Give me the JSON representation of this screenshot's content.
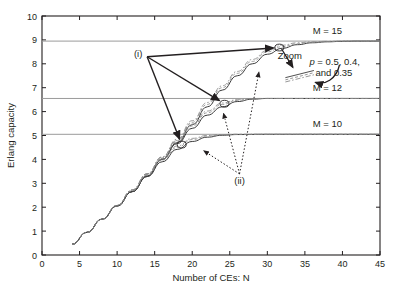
{
  "chart_data": {
    "type": "line",
    "title": "",
    "xlabel": "Number of CEs: N",
    "ylabel": "Erlang capacity",
    "xlim": [
      0,
      45
    ],
    "ylim": [
      0,
      10
    ],
    "xticks": [
      "0",
      "5",
      "10",
      "15",
      "20",
      "25",
      "30",
      "35",
      "40",
      "45"
    ],
    "yticks": [
      "0",
      "1",
      "2",
      "3",
      "4",
      "5",
      "6",
      "7",
      "8",
      "9",
      "10"
    ],
    "grid": false,
    "legend_position": "none",
    "series": [
      {
        "name": "M = 15, p = 0.5",
        "asymptote": 8.95,
        "style": "solid",
        "x": [
          4,
          6,
          8,
          10,
          12,
          14,
          16,
          18,
          20,
          22,
          24,
          26,
          28,
          30,
          32,
          34,
          36,
          38,
          40,
          42,
          45
        ],
        "y": [
          0.45,
          0.95,
          1.5,
          2.05,
          2.65,
          3.3,
          4.0,
          4.7,
          5.45,
          6.2,
          6.9,
          7.5,
          8.0,
          8.4,
          8.65,
          8.8,
          8.88,
          8.92,
          8.94,
          8.95,
          8.95
        ]
      },
      {
        "name": "M = 15, p = 0.4",
        "asymptote": 8.95,
        "style": "dashed",
        "x": [
          4,
          6,
          8,
          10,
          12,
          14,
          16,
          18,
          20,
          22,
          24,
          26,
          28,
          30,
          32,
          34,
          36,
          38,
          40,
          42,
          45
        ],
        "y": [
          0.45,
          0.95,
          1.5,
          2.05,
          2.68,
          3.35,
          4.05,
          4.78,
          5.55,
          6.3,
          7.0,
          7.6,
          8.1,
          8.5,
          8.72,
          8.84,
          8.9,
          8.93,
          8.95,
          8.95,
          8.95
        ]
      },
      {
        "name": "M = 15, p = 0.35",
        "asymptote": 8.95,
        "style": "dashdot",
        "x": [
          4,
          6,
          8,
          10,
          12,
          14,
          16,
          18,
          20,
          22,
          24,
          26,
          28,
          30,
          32,
          34,
          36,
          38,
          40,
          42,
          45
        ],
        "y": [
          0.45,
          0.95,
          1.5,
          2.08,
          2.72,
          3.4,
          4.1,
          4.85,
          5.62,
          6.38,
          7.08,
          7.68,
          8.18,
          8.56,
          8.78,
          8.88,
          8.92,
          8.94,
          8.95,
          8.95,
          8.95
        ]
      },
      {
        "name": "M = 12, p = 0.5",
        "asymptote": 6.55,
        "style": "solid",
        "x": [
          4,
          6,
          8,
          10,
          12,
          14,
          16,
          18,
          20,
          22,
          24,
          26,
          28,
          30,
          34,
          38,
          42,
          45
        ],
        "y": [
          0.45,
          0.95,
          1.5,
          2.05,
          2.65,
          3.3,
          4.0,
          4.66,
          5.3,
          5.85,
          6.2,
          6.42,
          6.52,
          6.55,
          6.55,
          6.55,
          6.55,
          6.55
        ]
      },
      {
        "name": "M = 12, p = 0.4",
        "asymptote": 6.55,
        "style": "dashed",
        "x": [
          4,
          6,
          8,
          10,
          12,
          14,
          16,
          18,
          20,
          22,
          24,
          26,
          28,
          30,
          34,
          38,
          42,
          45
        ],
        "y": [
          0.45,
          0.95,
          1.5,
          2.05,
          2.68,
          3.35,
          4.05,
          4.74,
          5.4,
          5.95,
          6.3,
          6.47,
          6.54,
          6.55,
          6.55,
          6.55,
          6.55,
          6.55
        ]
      },
      {
        "name": "M = 12, p = 0.35",
        "asymptote": 6.55,
        "style": "dashdot",
        "x": [
          4,
          6,
          8,
          10,
          12,
          14,
          16,
          18,
          20,
          22,
          24,
          26,
          28,
          30,
          34,
          38,
          42,
          45
        ],
        "y": [
          0.45,
          0.95,
          1.5,
          2.08,
          2.72,
          3.4,
          4.1,
          4.8,
          5.48,
          6.02,
          6.36,
          6.5,
          6.55,
          6.55,
          6.55,
          6.55,
          6.55,
          6.55
        ]
      },
      {
        "name": "M = 10, p = 0.5",
        "asymptote": 5.05,
        "style": "solid",
        "x": [
          4,
          6,
          8,
          10,
          12,
          14,
          16,
          18,
          20,
          22,
          24,
          26,
          30,
          34,
          38,
          42,
          45
        ],
        "y": [
          0.45,
          0.95,
          1.5,
          2.05,
          2.65,
          3.28,
          3.9,
          4.42,
          4.75,
          4.93,
          5.01,
          5.04,
          5.05,
          5.05,
          5.05,
          5.05,
          5.05
        ]
      },
      {
        "name": "M = 10, p = 0.4",
        "asymptote": 5.05,
        "style": "dashed",
        "x": [
          4,
          6,
          8,
          10,
          12,
          14,
          16,
          18,
          20,
          22,
          24,
          26,
          30,
          34,
          38,
          42,
          45
        ],
        "y": [
          0.45,
          0.95,
          1.5,
          2.05,
          2.68,
          3.33,
          3.97,
          4.5,
          4.83,
          4.98,
          5.03,
          5.05,
          5.05,
          5.05,
          5.05,
          5.05,
          5.05
        ]
      },
      {
        "name": "M = 10, p = 0.35",
        "asymptote": 5.05,
        "style": "dashdot",
        "x": [
          4,
          6,
          8,
          10,
          12,
          14,
          16,
          18,
          20,
          22,
          24,
          26,
          30,
          34,
          38,
          42,
          45
        ],
        "y": [
          0.45,
          0.95,
          1.5,
          2.08,
          2.72,
          3.38,
          4.02,
          4.56,
          4.88,
          5.0,
          5.04,
          5.05,
          5.05,
          5.05,
          5.05,
          5.05,
          5.05
        ]
      }
    ],
    "asymptote_lines": [
      {
        "label": "M = 15",
        "value": 8.95
      },
      {
        "label": "M = 12",
        "value": 6.55
      },
      {
        "label": "M = 10",
        "value": 5.05
      }
    ],
    "markers": [
      {
        "label": "M = 15 knee",
        "x": 31.6,
        "y": 8.68
      },
      {
        "label": "M = 12 knee",
        "x": 24.3,
        "y": 6.33
      },
      {
        "label": "M = 10 knee",
        "x": 18.6,
        "y": 4.62
      }
    ],
    "annotations": [
      {
        "name": "label-i",
        "text": "(i)",
        "x": 12.8,
        "y": 8.42
      },
      {
        "name": "label-ii",
        "text": "(ii)",
        "x": 26.3,
        "y": 3.1
      },
      {
        "name": "zoom-callout",
        "text": "Zoom",
        "x": 33.0,
        "y": 8.2
      },
      {
        "name": "p-values-line1",
        "text": "p = 0.5, 0.4,",
        "x": 37.2,
        "y": 7.95
      },
      {
        "name": "p-values-line2",
        "text": "and 0.35",
        "x": 38.0,
        "y": 7.5
      }
    ]
  },
  "labels": {
    "m15": "M = 15",
    "m12": "M = 12",
    "m10": "M = 10",
    "zoom": "Zoom",
    "p_italic": "p",
    "p_rest": " = 0.5, 0.4,",
    "p_line2": "and 0.35",
    "marker_i": "(i)",
    "marker_ii": "(ii)"
  },
  "colors": {
    "axis": "#231f20",
    "curve_dark": "#3b3b3b",
    "curve_grey": "#8a8a8a",
    "asymptote": "#9a9a9a",
    "annotation": "#231f20"
  }
}
